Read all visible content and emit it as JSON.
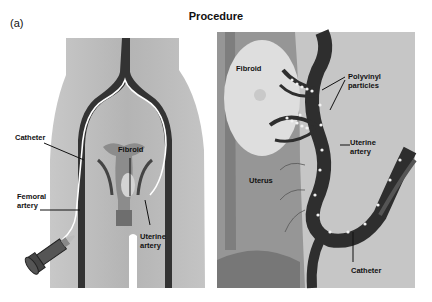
{
  "figure": {
    "panel_tag": "(a)",
    "title": "Procedure"
  },
  "left_panel": {
    "labels": {
      "catheter": "Catheter",
      "fibroid": "Fibroid",
      "femoral_artery": "Femoral\nartery",
      "uterine_artery": "Uterine\nartery"
    }
  },
  "right_panel": {
    "labels": {
      "fibroid": "Fibroid",
      "polyvinyl_particles": "Polyvinyl\nparticles",
      "uterine_artery": "Uterine\nartery",
      "uterus": "Uterus",
      "catheter": "Catheter"
    }
  },
  "colors": {
    "skin": "#b9b9b9",
    "artery": "#3a3a3a",
    "uterus": "#8f8f8f",
    "fibroid_light": "#d8d8d8",
    "background_right": "#c6c6c6"
  }
}
